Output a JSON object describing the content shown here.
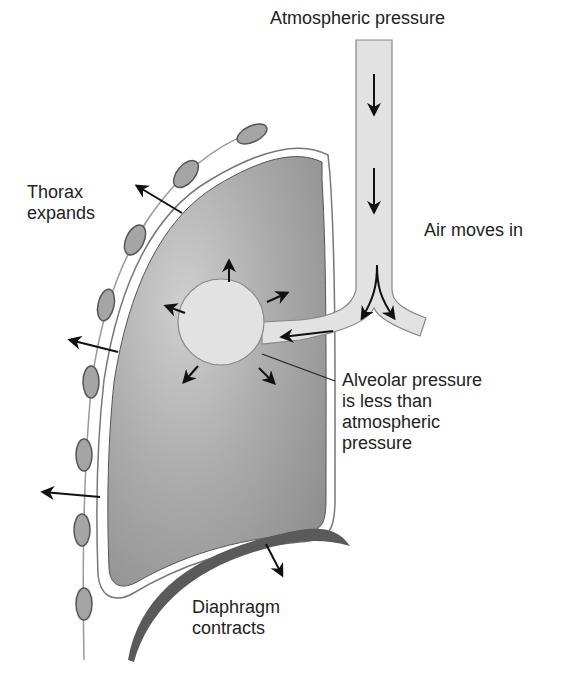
{
  "labels": {
    "atmospheric": "Atmospheric pressure",
    "thorax": "Thorax\nexpands",
    "air_in": "Air moves in",
    "alveolar": "Alveolar pressure\nis less than\natmospheric\npressure",
    "diaphragm": "Diaphragm\ncontracts"
  },
  "colors": {
    "lung": "#a9a9a9",
    "lung_light": "#cfcfcf",
    "airway": "#e2e2e2",
    "rib": "#9e9e9e",
    "diaphragm": "#5a5a5a",
    "arrow": "#111111"
  }
}
